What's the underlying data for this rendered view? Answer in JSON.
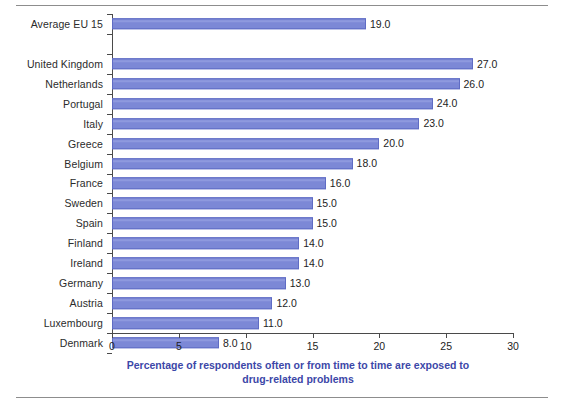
{
  "chart_data": {
    "type": "bar",
    "orientation": "horizontal",
    "title": "",
    "subtitle": "",
    "xlabel": "Percentage of respondents often or from time to time are exposed to drug-related problems",
    "xlabel_line1": "Percentage of respondents often or from time to time are exposed to",
    "xlabel_line2": "drug-related problems",
    "ylabel": "",
    "xlim": [
      0,
      30
    ],
    "xticks": [
      0,
      5,
      10,
      15,
      20,
      25,
      30
    ],
    "xtick_labels": [
      "0",
      "5",
      "10",
      "15",
      "20",
      "25",
      "30"
    ],
    "grid": false,
    "legend": false,
    "bar_color": "#7c88d6",
    "bar_edge_color": "#5f6cc4",
    "axis_title_color": "#3c47a8",
    "label_color": "#2b2b2b",
    "categories": [
      "Average EU 15",
      "",
      "United Kingdom",
      "Netherlands",
      "Portugal",
      "Italy",
      "Greece",
      "Belgium",
      "France",
      "Sweden",
      "Spain",
      "Finland",
      "Ireland",
      "Germany",
      "Austria",
      "Luxembourg",
      "Denmark"
    ],
    "values": [
      19.0,
      null,
      27.0,
      26.0,
      24.0,
      23.0,
      20.0,
      18.0,
      16.0,
      15.0,
      15.0,
      14.0,
      14.0,
      13.0,
      12.0,
      11.0,
      8.0
    ],
    "value_labels": [
      "19.0",
      "",
      "27.0",
      "26.0",
      "24.0",
      "23.0",
      "20.0",
      "18.0",
      "16.0",
      "15.0",
      "15.0",
      "14.0",
      "14.0",
      "13.0",
      "12.0",
      "11.0",
      "8.0"
    ],
    "rows": [
      {
        "category": "Average EU 15",
        "value": 19.0,
        "label": "19.0"
      },
      {
        "category": "",
        "value": null,
        "label": ""
      },
      {
        "category": "United Kingdom",
        "value": 27.0,
        "label": "27.0"
      },
      {
        "category": "Netherlands",
        "value": 26.0,
        "label": "26.0"
      },
      {
        "category": "Portugal",
        "value": 24.0,
        "label": "24.0"
      },
      {
        "category": "Italy",
        "value": 23.0,
        "label": "23.0"
      },
      {
        "category": "Greece",
        "value": 20.0,
        "label": "20.0"
      },
      {
        "category": "Belgium",
        "value": 18.0,
        "label": "18.0"
      },
      {
        "category": "France",
        "value": 16.0,
        "label": "16.0"
      },
      {
        "category": "Sweden",
        "value": 15.0,
        "label": "15.0"
      },
      {
        "category": "Spain",
        "value": 15.0,
        "label": "15.0"
      },
      {
        "category": "Finland",
        "value": 14.0,
        "label": "14.0"
      },
      {
        "category": "Ireland",
        "value": 14.0,
        "label": "14.0"
      },
      {
        "category": "Germany",
        "value": 13.0,
        "label": "13.0"
      },
      {
        "category": "Austria",
        "value": 12.0,
        "label": "12.0"
      },
      {
        "category": "Luxembourg",
        "value": 11.0,
        "label": "11.0"
      },
      {
        "category": "Denmark",
        "value": 8.0,
        "label": "8.0"
      }
    ]
  }
}
